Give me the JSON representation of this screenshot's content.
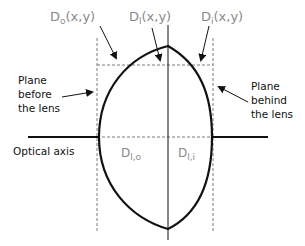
{
  "diagram": {
    "labels": {
      "d_o": {
        "main": "D",
        "sub": "o",
        "suffix": "(x,y)"
      },
      "d_l": {
        "main": "D",
        "sub": "l",
        "suffix": "(x,y)"
      },
      "d_i": {
        "main": "D",
        "sub": "i",
        "suffix": "(x,y)"
      },
      "d_lo": {
        "main": "D",
        "sub": "l,o"
      },
      "d_li": {
        "main": "D",
        "sub": "l,i"
      },
      "plane_before": [
        "Plane",
        "before",
        "the lens"
      ],
      "plane_behind": [
        "Plane",
        "behind",
        "the lens"
      ],
      "optical_axis": "Optical axis"
    },
    "colors": {
      "line": "#111111",
      "dashed": "#7a7a7a",
      "label_gray": "#8a8a8a"
    }
  }
}
